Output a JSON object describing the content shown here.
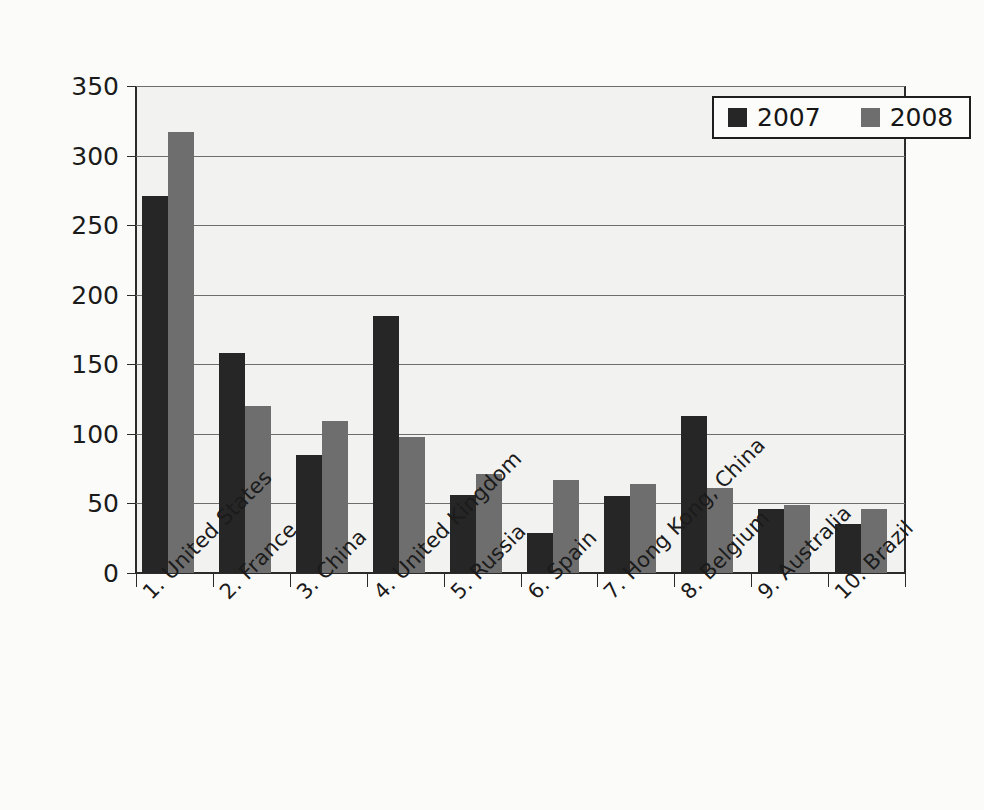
{
  "chart_data": {
    "type": "bar",
    "title": "",
    "subtitle": "",
    "xlabel": "",
    "ylabel": "",
    "ylim": [
      0,
      350
    ],
    "yticks": [
      0,
      50,
      100,
      150,
      200,
      250,
      300,
      350
    ],
    "ytick_labels": [
      "0",
      "50",
      "100",
      "150",
      "200",
      "250",
      "300",
      "350"
    ],
    "grid": true,
    "legend_position": "top-right",
    "categories": [
      "1. United States",
      "2. France",
      "3. China",
      "4. United Kingdom",
      "5. Russia",
      "6. Spain",
      "7. Hong Kong, China",
      "8. Belgium",
      "9. Australia",
      "10. Brazil"
    ],
    "series": [
      {
        "name": "2007",
        "color": "#262626",
        "values": [
          271,
          158,
          85,
          185,
          56,
          29,
          55,
          113,
          46,
          35
        ]
      },
      {
        "name": "2008",
        "color": "#6e6e6e",
        "values": [
          317,
          120,
          109,
          98,
          71,
          67,
          64,
          61,
          49,
          46
        ]
      }
    ]
  },
  "legend": {
    "entries": [
      {
        "label": "2007",
        "swatch": "black-square-swatch"
      },
      {
        "label": "2008",
        "swatch": "gray-square-swatch"
      }
    ]
  },
  "colors": {
    "background": "#fbfbfa",
    "plot_background": "#f2f2f0",
    "axis": "#2b2b2b",
    "gridline": "#6d6d6d",
    "series_2007": "#262626",
    "series_2008": "#6e6e6e",
    "text": "#1b1b1b"
  }
}
